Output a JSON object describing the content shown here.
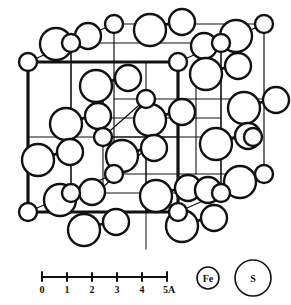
{
  "figure": {
    "projection": "oblique cube",
    "background": "#ffffff",
    "ink": "#111111"
  },
  "scale_bar": {
    "name": "angstrom-scale-bar",
    "ticks": [
      "0",
      "1",
      "2",
      "3",
      "4"
    ],
    "end_label": "5A",
    "unit": "A",
    "min": 0,
    "max": 5
  },
  "legend": {
    "items": [
      {
        "symbol": "Fe",
        "role": "iron-atom",
        "radius_px": 11
      },
      {
        "symbol": "S",
        "role": "sulfur-atom",
        "radius_px": 18
      }
    ]
  },
  "structure": {
    "cube": {
      "front": {
        "x": 28,
        "y": 62,
        "w": 150,
        "h": 150
      },
      "depth_dx": 86,
      "depth_dy": -38,
      "front_stroke": 3.2,
      "back_stroke": 1.2,
      "mid_stroke": 1.2
    },
    "atoms": {
      "fe_radius": 9,
      "s_radius": 16,
      "fe_positions": [
        [
          28,
          62
        ],
        [
          178,
          62
        ],
        [
          28,
          212
        ],
        [
          178,
          212
        ],
        [
          114,
          24
        ],
        [
          264,
          24
        ],
        [
          114,
          174
        ],
        [
          264,
          174
        ],
        [
          103,
          137
        ],
        [
          253,
          137
        ],
        [
          71,
          43
        ],
        [
          221,
          43
        ],
        [
          71,
          193
        ],
        [
          221,
          193
        ],
        [
          146,
          99
        ],
        [
          146,
          99
        ]
      ],
      "s_pairs": [
        {
          "a": [
            56,
            44
          ],
          "b": [
            88,
            36
          ],
          "bond": 1
        },
        {
          "a": [
            150,
            30
          ],
          "b": [
            182,
            22
          ],
          "bond": 1
        },
        {
          "a": [
            236,
            36
          ],
          "b": [
            204,
            46
          ],
          "bond": 1
        },
        {
          "a": [
            96,
            86
          ],
          "b": [
            128,
            78
          ],
          "bond": 1
        },
        {
          "a": [
            206,
            74
          ],
          "b": [
            238,
            66
          ],
          "bond": 1
        },
        {
          "a": [
            66,
            124
          ],
          "b": [
            98,
            116
          ],
          "bond": 1
        },
        {
          "a": [
            150,
            120
          ],
          "b": [
            182,
            112
          ],
          "bond": 1
        },
        {
          "a": [
            244,
            108
          ],
          "b": [
            276,
            100
          ],
          "bond": 1
        },
        {
          "a": [
            38,
            160
          ],
          "b": [
            70,
            152
          ],
          "bond": 1
        },
        {
          "a": [
            122,
            156
          ],
          "b": [
            154,
            148
          ],
          "bond": 1
        },
        {
          "a": [
            216,
            144
          ],
          "b": [
            248,
            136
          ],
          "bond": 1
        },
        {
          "a": [
            60,
            200
          ],
          "b": [
            92,
            192
          ],
          "bond": 1
        },
        {
          "a": [
            156,
            196
          ],
          "b": [
            188,
            188
          ],
          "bond": 1
        },
        {
          "a": [
            240,
            182
          ],
          "b": [
            208,
            190
          ],
          "bond": 1
        },
        {
          "a": [
            84,
            230
          ],
          "b": [
            116,
            222
          ],
          "bond": 1
        },
        {
          "a": [
            182,
            226
          ],
          "b": [
            214,
            218
          ],
          "bond": 1
        }
      ]
    }
  }
}
